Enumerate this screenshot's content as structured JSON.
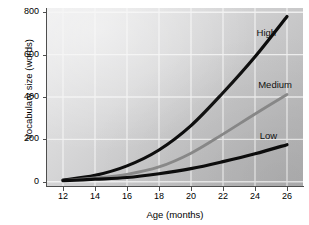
{
  "chart_data": {
    "type": "line",
    "title": "",
    "xlabel": "Age (months)",
    "ylabel": "Vocabulary size (words)",
    "xlim": [
      11,
      27
    ],
    "ylim": [
      -20,
      820
    ],
    "xticks": [
      12,
      14,
      16,
      18,
      20,
      22,
      24,
      26
    ],
    "yticks": [
      0,
      200,
      400,
      600,
      800
    ],
    "grid": true,
    "legend_position": "inline-end-of-line",
    "x": [
      12,
      14,
      16,
      18,
      20,
      22,
      24,
      26
    ],
    "series": [
      {
        "name": "High",
        "label": "High",
        "color": "#0d0d0d",
        "width": 3.2,
        "values": [
          8,
          30,
          75,
          150,
          265,
          420,
          590,
          780
        ]
      },
      {
        "name": "Medium",
        "label": "Medium",
        "color": "#8c8c8c",
        "width": 2.8,
        "values": [
          6,
          18,
          35,
          70,
          135,
          225,
          320,
          412
        ]
      },
      {
        "name": "Low",
        "label": "Low",
        "color": "#0d0d0d",
        "width": 3.2,
        "values": [
          5,
          12,
          20,
          38,
          62,
          95,
          132,
          175
        ]
      }
    ],
    "annotations": [
      {
        "text": "High",
        "x": 24.1,
        "y": 700
      },
      {
        "text": "Medium",
        "x": 24.2,
        "y": 455
      },
      {
        "text": "Low",
        "x": 24.3,
        "y": 215
      }
    ]
  },
  "axes": {
    "y_title": "Vocabulary size (words)",
    "x_title": "Age (months)",
    "y_tick_labels": [
      "800",
      "600",
      "400",
      "200",
      "0"
    ],
    "x_tick_labels": [
      "12",
      "14",
      "16",
      "18",
      "20",
      "22",
      "24",
      "26"
    ]
  },
  "colors": {
    "high_line": "#0d0d0d",
    "medium_line": "#8c8c8c",
    "low_line": "#0d0d0d",
    "grid": "#f2f2f2",
    "axis": "#4e4e4e",
    "panel_light": "#ececed",
    "panel_dark": "#b4b4b5",
    "text": "#000000",
    "figure_bg": "#ffffff"
  }
}
